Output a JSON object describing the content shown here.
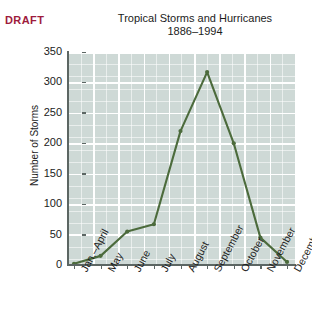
{
  "figure": {
    "draft_label": "DRAFT",
    "draft_color": "#9e1b3c",
    "background": "#ffffff",
    "plot_background": "#ced9d6",
    "grid_color": "#ffffff",
    "axis_color": "#5c6663",
    "line_color": "#4c6b3c"
  },
  "chart_data": {
    "type": "line",
    "title": "Tropical Storms and Hurricanes",
    "subtitle": "1886–1994",
    "xlabel": "",
    "ylabel": "Number of Storms",
    "categories": [
      "Jan.–April",
      "May",
      "June",
      "July",
      "August",
      "September",
      "October",
      "November",
      "December"
    ],
    "values": [
      2,
      15,
      55,
      67,
      220,
      317,
      200,
      45,
      5
    ],
    "ylim": [
      0,
      350
    ],
    "yticks": [
      0,
      50,
      100,
      150,
      200,
      250,
      300,
      350
    ],
    "ytick_labels": [
      "0",
      "50",
      "100",
      "150",
      "200",
      "250",
      "300",
      "350"
    ],
    "grid": true,
    "legend": "none",
    "markers": true,
    "series_name": "Number of Storms"
  }
}
